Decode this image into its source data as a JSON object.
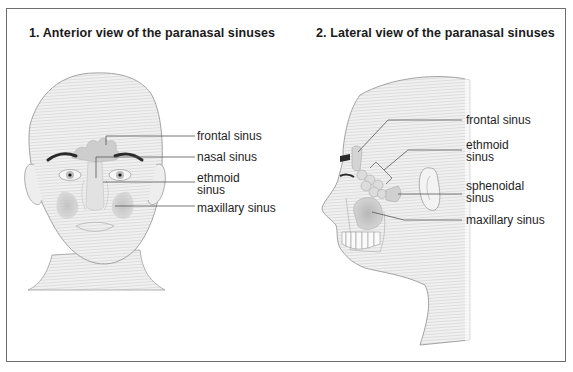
{
  "panels": [
    {
      "title": "1. Anterior view of the paranasal sinuses",
      "view": "anterior",
      "labels": [
        {
          "text": "frontal sinus"
        },
        {
          "text": "nasal sinus"
        },
        {
          "text_line1": "ethmoid",
          "text_line2": "sinus"
        },
        {
          "text": "maxillary sinus"
        }
      ]
    },
    {
      "title": "2. Lateral view of the paranasal sinuses",
      "view": "lateral",
      "labels": [
        {
          "text": "frontal sinus"
        },
        {
          "text_line1": "ethmoid",
          "text_line2": "sinus"
        },
        {
          "text_line1": "sphenoidal",
          "text_line2": "sinus"
        },
        {
          "text": "maxillary sinus"
        }
      ]
    }
  ],
  "colors": {
    "frame": "#6e6e6e",
    "skin_fill": "#ececec",
    "outline": "#9a9a9a",
    "sinus_fill": "#c8c8c8",
    "leader_line": "#555555",
    "eyebrow": "#2a2a2a"
  }
}
